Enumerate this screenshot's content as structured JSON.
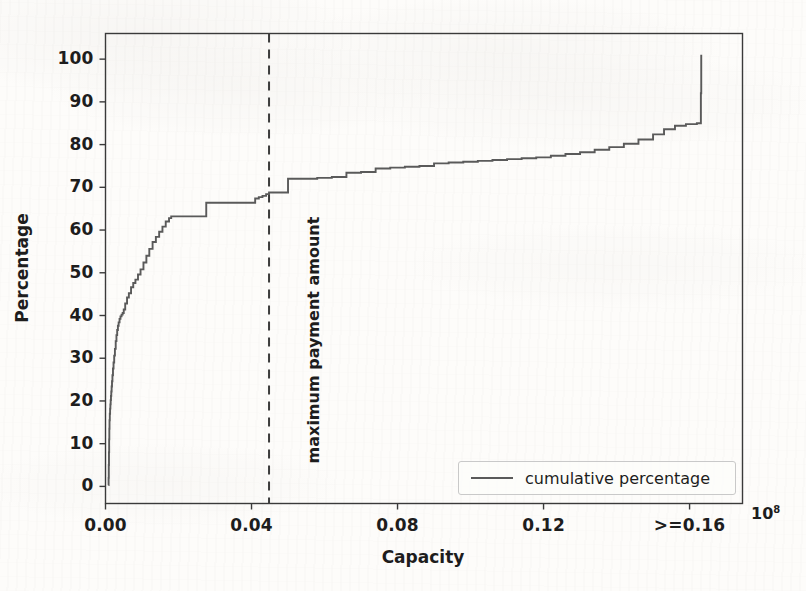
{
  "chart_data": {
    "type": "line",
    "title": "",
    "xlabel": "Capacity",
    "ylabel": "Percentage",
    "x_exponent_label": "10^8",
    "x_exponent_base": "10",
    "x_exponent_power": "8",
    "xlim": [
      0.0,
      0.1745
    ],
    "ylim": [
      -4,
      106
    ],
    "grid": false,
    "legend_position": "lower right",
    "series": [
      {
        "name": "cumulative percentage",
        "color": "#5a5a5a",
        "drawstyle": "steps-post",
        "x": [
          0.0008,
          0.00085,
          0.0009,
          0.00095,
          0.001,
          0.00105,
          0.0011,
          0.00118,
          0.00126,
          0.00134,
          0.00142,
          0.0015,
          0.00158,
          0.00168,
          0.00178,
          0.0019,
          0.00205,
          0.0022,
          0.00238,
          0.00258,
          0.0028,
          0.003,
          0.0032,
          0.0034,
          0.0036,
          0.00385,
          0.0041,
          0.0044,
          0.0047,
          0.005,
          0.0054,
          0.0059,
          0.0064,
          0.007,
          0.0076,
          0.0082,
          0.0089,
          0.0096,
          0.0104,
          0.0112,
          0.012,
          0.0129,
          0.0138,
          0.0147,
          0.0156,
          0.0165,
          0.0174,
          0.018,
          0.0181,
          0.021,
          0.024,
          0.027,
          0.0276,
          0.03,
          0.033,
          0.036,
          0.039,
          0.041,
          0.042,
          0.043,
          0.044,
          0.0448,
          0.046,
          0.048,
          0.0498,
          0.05,
          0.054,
          0.058,
          0.062,
          0.066,
          0.07,
          0.074,
          0.078,
          0.082,
          0.086,
          0.09,
          0.094,
          0.098,
          0.102,
          0.106,
          0.11,
          0.114,
          0.118,
          0.122,
          0.126,
          0.13,
          0.134,
          0.138,
          0.142,
          0.146,
          0.15,
          0.153,
          0.156,
          0.159,
          0.162,
          0.163,
          0.1631,
          0.1632
        ],
        "y": [
          0.3,
          2.0,
          5.0,
          8.0,
          11.0,
          13.5,
          15.5,
          17.0,
          18.2,
          19.2,
          20.2,
          21.2,
          22.2,
          23.4,
          24.6,
          26.0,
          27.6,
          29.0,
          30.6,
          32.2,
          34.0,
          35.4,
          36.6,
          37.6,
          38.4,
          39.2,
          39.8,
          40.2,
          40.6,
          41.4,
          42.8,
          44.2,
          45.2,
          46.6,
          47.6,
          48.4,
          49.6,
          50.8,
          52.4,
          54.0,
          55.6,
          57.2,
          58.4,
          59.6,
          60.8,
          62.0,
          62.8,
          63.2,
          63.2,
          63.2,
          63.2,
          63.2,
          66.4,
          66.4,
          66.4,
          66.4,
          66.4,
          67.4,
          67.7,
          68.0,
          68.4,
          68.8,
          68.8,
          68.8,
          68.8,
          72.0,
          72.0,
          72.2,
          72.4,
          73.4,
          73.6,
          74.4,
          74.6,
          74.8,
          75.0,
          75.6,
          75.8,
          76.0,
          76.2,
          76.4,
          76.6,
          76.8,
          77.0,
          77.4,
          77.8,
          78.2,
          78.8,
          79.4,
          80.2,
          81.2,
          82.4,
          83.6,
          84.4,
          84.8,
          85.0,
          85.0,
          92.0,
          101.0
        ],
        "notable_points": {
          "start": {
            "x": 0.0008,
            "y": 0.3
          },
          "knee_40pct": {
            "x": 0.0047,
            "y": 40.6
          },
          "plateau_63pct": {
            "x": 0.018,
            "y": 63.2
          },
          "at_max_payment_line": {
            "x": 0.0448,
            "y": 68.8
          },
          "step_to_72pct": {
            "x": 0.05,
            "y": 72.0
          },
          "before_final_jump": {
            "x": 0.1631,
            "y": 85.0
          },
          "final": {
            "x": 0.1632,
            "y": 101.0
          }
        }
      }
    ],
    "yticks": [
      0,
      10,
      20,
      30,
      40,
      50,
      60,
      70,
      80,
      90,
      100
    ],
    "ytick_labels": [
      "0",
      "10",
      "20",
      "30",
      "40",
      "50",
      "60",
      "70",
      "80",
      "90",
      "100"
    ],
    "xticks": [
      0.0,
      0.04,
      0.08,
      0.12,
      0.16
    ],
    "xtick_labels": [
      "0.00",
      "0.04",
      "0.08",
      "0.12",
      ">=0.16"
    ],
    "annotations": [
      {
        "name": "maximum-payment-amount",
        "text": "maximum payment amount",
        "type": "vertical-dashed-line",
        "x": 0.0448,
        "color": "#3c3c3c",
        "linestyle": "dashed",
        "rotation": 90
      }
    ],
    "legend": {
      "entries": [
        {
          "label": "cumulative percentage",
          "color": "#5a5a5a"
        }
      ]
    },
    "colors": {
      "line": "#5a5a5a",
      "annotation_line": "#3c3c3c",
      "axes": "#3a3a3a",
      "text": "#1d1d1d",
      "background": "#fdfcfa"
    }
  }
}
